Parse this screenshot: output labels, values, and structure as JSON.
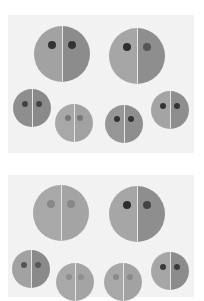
{
  "figure": {
    "panels": [
      {
        "id": "top",
        "top": 15,
        "height": 138,
        "faces": [
          {
            "cx": 62,
            "cy": 54,
            "r": 28,
            "left": "#a2a2a2",
            "right": "#8c8c8c",
            "eye": "#333333",
            "eyeR": 4,
            "eyeDx": 10,
            "eyeDy": -9
          },
          {
            "cx": 137,
            "cy": 56,
            "r": 28,
            "left": "#a6a6a6",
            "right": "#8e8e8e",
            "eye": "#2e2e2e",
            "eye2": "#555555",
            "eyeR": 4,
            "eyeDx": 10,
            "eyeDy": -9
          },
          {
            "cx": 32,
            "cy": 108,
            "r": 19,
            "left": "#8e8e8e",
            "right": "#8a8a8a",
            "eye": "#444444",
            "eyeR": 3,
            "eyeDx": 7,
            "eyeDy": -4
          },
          {
            "cx": 74,
            "cy": 123,
            "r": 19,
            "left": "#a8a8a8",
            "right": "#a2a2a2",
            "eye": "#777777",
            "eyeR": 3,
            "eyeDx": 6,
            "eyeDy": -5
          },
          {
            "cx": 124,
            "cy": 124,
            "r": 19,
            "left": "#969696",
            "right": "#8e8e8e",
            "eye": "#333333",
            "eyeR": 3,
            "eyeDx": 7,
            "eyeDy": -5
          },
          {
            "cx": 170,
            "cy": 110,
            "r": 19,
            "left": "#a4a4a4",
            "right": "#8e8e8e",
            "eye": "#333333",
            "eyeR": 3,
            "eyeDx": 7,
            "eyeDy": -4
          }
        ]
      },
      {
        "id": "bottom",
        "top": 175,
        "height": 122,
        "faces": [
          {
            "cx": 61,
            "cy": 213,
            "r": 28,
            "left": "#a8a8a8",
            "right": "#a4a4a4",
            "eye": "#888888",
            "eyeR": 4,
            "eyeDx": 10,
            "eyeDy": -9
          },
          {
            "cx": 137,
            "cy": 214,
            "r": 28,
            "left": "#a6a6a6",
            "right": "#8e8e8e",
            "eye": "#2e2e2e",
            "eye2": "#444444",
            "eyeR": 4,
            "eyeDx": 10,
            "eyeDy": -9
          },
          {
            "cx": 31,
            "cy": 269,
            "r": 19,
            "left": "#a2a2a2",
            "right": "#8a8a8a",
            "eye": "#555555",
            "eyeR": 3,
            "eyeDx": 7,
            "eyeDy": -4
          },
          {
            "cx": 75,
            "cy": 282,
            "r": 19,
            "left": "#a8a8a8",
            "right": "#a4a4a4",
            "eye": "#8e8e8e",
            "eyeR": 3,
            "eyeDx": 6,
            "eyeDy": -5
          },
          {
            "cx": 123,
            "cy": 282,
            "r": 19,
            "left": "#a8a8a8",
            "right": "#a2a2a2",
            "eye": "#8a8a8a",
            "eyeR": 3,
            "eyeDx": 7,
            "eyeDy": -5
          },
          {
            "cx": 170,
            "cy": 271,
            "r": 19,
            "left": "#a6a6a6",
            "right": "#8c8c8c",
            "eye": "#3a3a3a",
            "eyeR": 3,
            "eyeDx": 7,
            "eyeDy": -4
          }
        ]
      }
    ]
  }
}
